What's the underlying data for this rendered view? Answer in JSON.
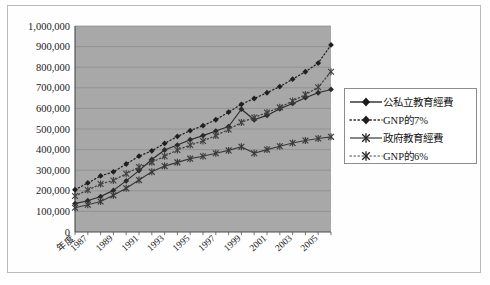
{
  "chart_data": {
    "type": "line",
    "title": "",
    "xlabel": "年度",
    "ylabel": "",
    "ylim": [
      0,
      1000000
    ],
    "ytick_step": 100000,
    "grid": true,
    "legend_position": "right-outside",
    "plot_background": "#a8a8a8",
    "ytick_labels": [
      "1,000,000",
      "900,000",
      "800,000",
      "700,000",
      "600,000",
      "500,000",
      "400,000",
      "300,000",
      "200,000",
      "100,000",
      "0"
    ],
    "x": [
      1986,
      1987,
      1988,
      1989,
      1990,
      1991,
      1992,
      1993,
      1994,
      1995,
      1996,
      1997,
      1998,
      1999,
      2000,
      2001,
      2002,
      2003,
      2004,
      2005,
      2006
    ],
    "xtick_labels": [
      "年度",
      "1987",
      "1989",
      "1991",
      "1993",
      "1995",
      "1997",
      "1999",
      "2001",
      "2003",
      "2005"
    ],
    "xtick_years": [
      1986,
      1987,
      1989,
      1991,
      1993,
      1995,
      1997,
      1999,
      2001,
      2003,
      2005
    ],
    "series": [
      {
        "name": "公私立教育經費",
        "style": "solid",
        "marker": "diamond",
        "color": "#2a2a2a",
        "values": [
          138000,
          152000,
          172000,
          202000,
          248000,
          298000,
          352000,
          398000,
          422000,
          448000,
          468000,
          490000,
          512000,
          596000,
          545000,
          566000,
          598000,
          624000,
          652000,
          676000,
          692000
        ]
      },
      {
        "name": "GNP的7%",
        "style": "dotted",
        "marker": "diamond",
        "color": "#1f1f1f",
        "values": [
          205000,
          238000,
          272000,
          292000,
          330000,
          368000,
          394000,
          430000,
          464000,
          492000,
          516000,
          545000,
          582000,
          620000,
          648000,
          676000,
          706000,
          742000,
          778000,
          820000,
          908000
        ]
      },
      {
        "name": "政府教育經費",
        "style": "solid",
        "marker": "asterisk",
        "color": "#3a3a3a",
        "values": [
          118000,
          132000,
          148000,
          178000,
          212000,
          252000,
          292000,
          320000,
          338000,
          356000,
          368000,
          382000,
          396000,
          414000,
          382000,
          400000,
          416000,
          432000,
          444000,
          454000,
          462000
        ]
      },
      {
        "name": "GNP的6%",
        "style": "dotted",
        "marker": "asterisk",
        "color": "#404040",
        "values": [
          175000,
          204000,
          233000,
          250000,
          283000,
          315000,
          338000,
          368000,
          398000,
          422000,
          442000,
          468000,
          498000,
          532000,
          556000,
          580000,
          605000,
          636000,
          667000,
          703000,
          778000
        ]
      }
    ]
  },
  "legend": {
    "items": [
      {
        "label": "公私立教育經費",
        "style": "solid",
        "marker": "diamond"
      },
      {
        "label": "GNP的7%",
        "style": "dotted",
        "marker": "diamond"
      },
      {
        "label": "政府教育經費",
        "style": "solid",
        "marker": "asterisk"
      },
      {
        "label": "GNP的6%",
        "style": "dotted",
        "marker": "asterisk"
      }
    ]
  }
}
